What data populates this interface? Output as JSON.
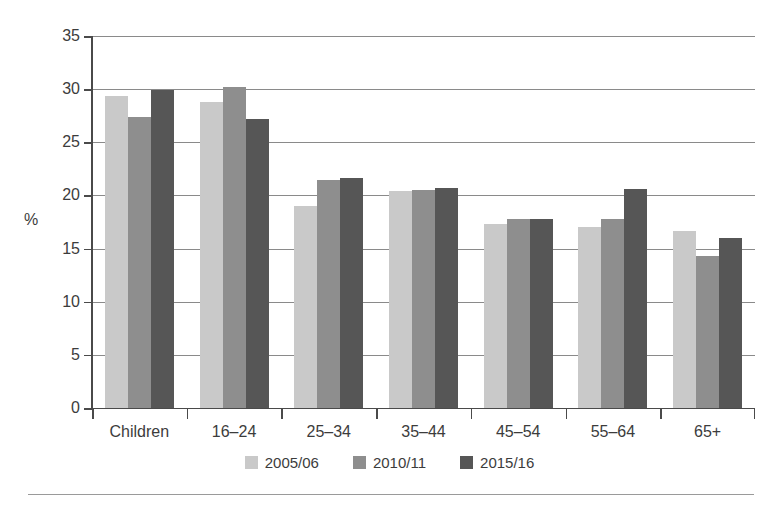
{
  "chart_data": {
    "type": "bar",
    "title": "",
    "subtitle": "",
    "xlabel": "",
    "ylabel": "%",
    "ylim": [
      0,
      35
    ],
    "yticks": [
      0,
      5,
      10,
      15,
      20,
      25,
      30,
      35
    ],
    "ytick_labels": [
      "0",
      "5",
      "10",
      "15",
      "20",
      "25",
      "30",
      "35"
    ],
    "grid": true,
    "grid_axis": "y",
    "legend_position": "bottom-center",
    "categories": [
      "Children",
      "16–24",
      "25–34",
      "35–44",
      "45–54",
      "55–64",
      "65+"
    ],
    "series": [
      {
        "name": "2005/06",
        "color": "#c9c9c9",
        "values": [
          29.4,
          28.8,
          19.0,
          20.4,
          17.3,
          17.0,
          16.7
        ]
      },
      {
        "name": "2010/11",
        "color": "#8e8e8e",
        "values": [
          27.4,
          30.2,
          21.5,
          20.5,
          17.8,
          17.8,
          14.3
        ]
      },
      {
        "name": "2015/16",
        "color": "#565656",
        "values": [
          29.9,
          27.2,
          21.6,
          20.7,
          17.8,
          20.6,
          16.0
        ]
      }
    ]
  },
  "legend": {
    "items": [
      {
        "label": "2005/06",
        "color": "#c9c9c9"
      },
      {
        "label": "2010/11",
        "color": "#8e8e8e"
      },
      {
        "label": "2015/16",
        "color": "#565656"
      }
    ]
  },
  "axes": {
    "y_label": "%"
  }
}
